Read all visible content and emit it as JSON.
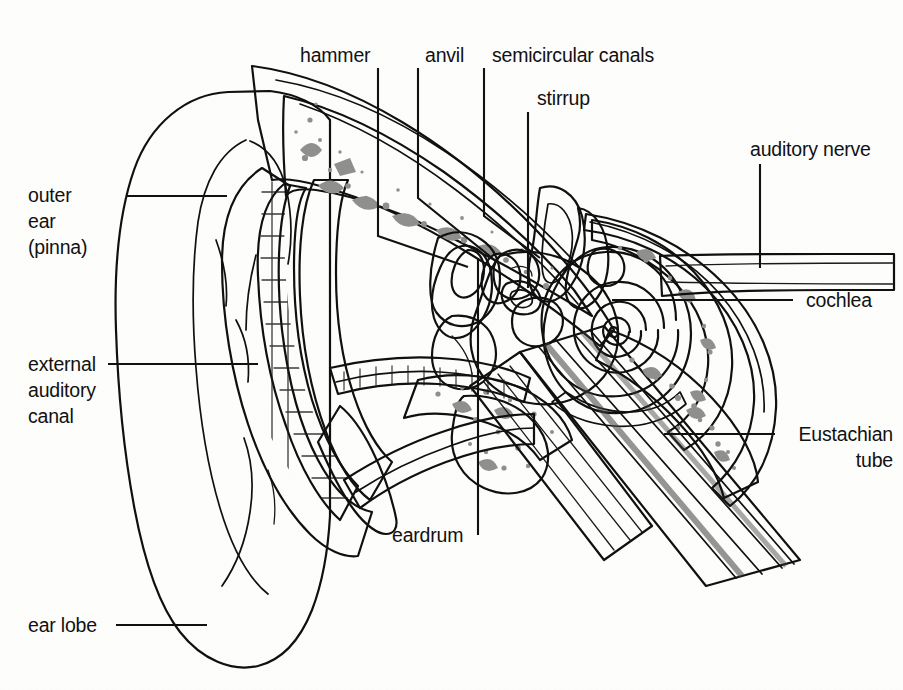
{
  "diagram": {
    "type": "labeled-anatomical-diagram",
    "canvas": {
      "width": 903,
      "height": 690
    },
    "background_color": "#fdfdfc",
    "line_color": "#111111",
    "palette": {
      "paper": "#fdfdfc",
      "pinna_fill": "#d8d8d6",
      "skin_shade": "#c6c6c4",
      "cartilage": "#a8a8a6",
      "bone_light": "#e3e3e1",
      "bone_speckle": "#8f8f8d",
      "canal_dark": "#6e6e6c",
      "ossicle_dark": "#3a3a3a",
      "inner_ear_mid": "#9a9a98",
      "nerve_gray": "#8c8c8a",
      "tube_band_dark": "#5d5d5b",
      "tube_band_light": "#b4b4b2"
    }
  },
  "labels": [
    {
      "id": "outer-ear",
      "lines": [
        "outer",
        "ear",
        "(pinna)"
      ],
      "align": "left",
      "text_x": 28,
      "text_y": 202,
      "line_height": 26,
      "leader": "M 126 196 L 227 196"
    },
    {
      "id": "external-auditory-canal",
      "lines": [
        "external",
        "auditory",
        "canal"
      ],
      "align": "left",
      "text_x": 28,
      "text_y": 371,
      "line_height": 26,
      "leader": "M 108 364 L 258 364"
    },
    {
      "id": "ear-lobe",
      "lines": [
        "ear lobe"
      ],
      "align": "left",
      "text_x": 28,
      "text_y": 632,
      "line_height": 26,
      "leader": "M 116 625 L 207 625"
    },
    {
      "id": "hammer",
      "lines": [
        "hammer"
      ],
      "align": "left",
      "text_x": 300,
      "text_y": 62,
      "line_height": 26,
      "leader": "M 378 68 L 378 236 L 468 267"
    },
    {
      "id": "anvil",
      "lines": [
        "anvil"
      ],
      "align": "left",
      "text_x": 425,
      "text_y": 62,
      "line_height": 26,
      "leader": "M 418 68 L 418 198 L 497 262"
    },
    {
      "id": "semicircular-canals",
      "lines": [
        "semicircular canals"
      ],
      "align": "left",
      "text_x": 492,
      "text_y": 62,
      "line_height": 26,
      "leader": "M 484 68 L 484 216 L 540 258"
    },
    {
      "id": "stirrup",
      "lines": [
        "stirrup"
      ],
      "align": "left",
      "text_x": 537,
      "text_y": 105,
      "line_height": 26,
      "leader": "M 528 112 L 528 288"
    },
    {
      "id": "auditory-nerve",
      "lines": [
        "auditory nerve"
      ],
      "align": "left",
      "text_x": 750,
      "text_y": 156,
      "line_height": 26,
      "leader": "M 760 164 L 760 258"
    },
    {
      "id": "cochlea",
      "lines": [
        "cochlea"
      ],
      "align": "left",
      "text_x": 806,
      "text_y": 307,
      "line_height": 26,
      "leader": "M 612 300 L 793 300"
    },
    {
      "id": "eustachian-tube",
      "lines": [
        "Eustachian",
        "tube"
      ],
      "align": "right",
      "text_x": 893,
      "text_y": 437,
      "line_height": 26,
      "leader": "M 664 434 L 775 434"
    },
    {
      "id": "eardrum",
      "lines": [
        "eardrum"
      ],
      "align": "left",
      "text_x": 392,
      "text_y": 542,
      "line_height": 26,
      "leader": "M 478 535 L 478 258"
    }
  ]
}
